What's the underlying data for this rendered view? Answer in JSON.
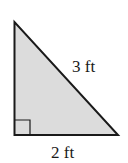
{
  "diagram": {
    "type": "right-triangle",
    "fill_color": "#dcdcdc",
    "stroke_color": "#1a1a1a",
    "labels": {
      "hypotenuse": "3 ft",
      "base": "2 ft"
    },
    "right_angle_marker": true
  }
}
